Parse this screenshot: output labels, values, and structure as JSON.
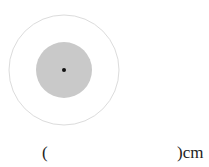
{
  "figure": {
    "outer_circle": {
      "cx": 64,
      "cy": 70,
      "r": 55,
      "stroke": "#dcdcdc",
      "fill": "#ffffff"
    },
    "inner_circle": {
      "cx": 64,
      "cy": 70,
      "r": 28,
      "fill": "#c9c9c9"
    },
    "center_dot": {
      "cx": 64,
      "cy": 70,
      "r": 2,
      "fill": "#111111"
    }
  },
  "answer_blank": {
    "open_paren": "(",
    "close_unit": ")cm"
  }
}
